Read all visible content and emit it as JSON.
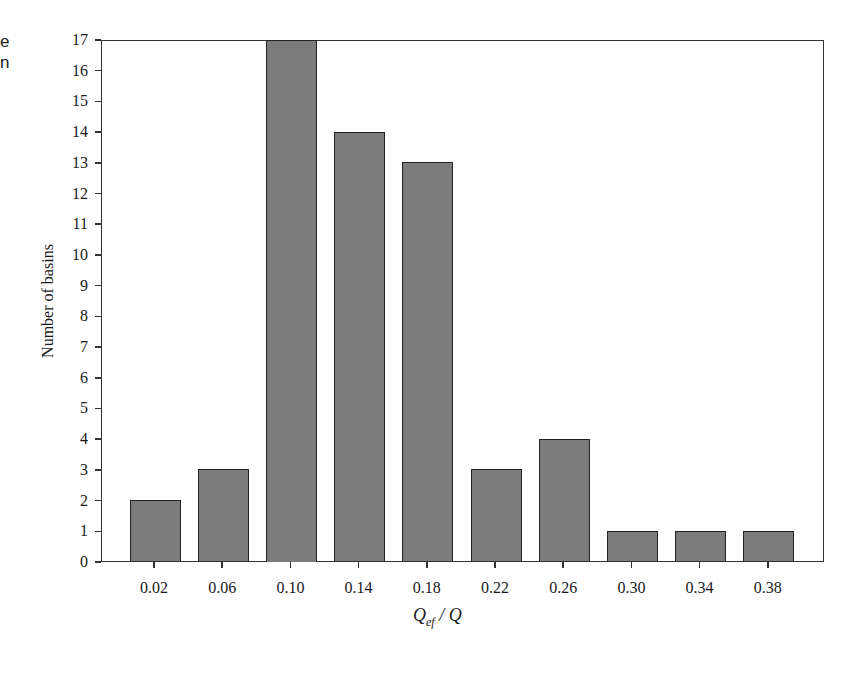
{
  "page_fragment": {
    "line1": "e",
    "line2": "n"
  },
  "chart_data": {
    "type": "bar",
    "title": "",
    "categories": [
      "0.02",
      "0.06",
      "0.10",
      "0.14",
      "0.18",
      "0.22",
      "0.26",
      "0.30",
      "0.34",
      "0.38"
    ],
    "values": [
      2,
      3,
      17,
      14,
      13,
      3,
      4,
      1,
      1,
      1
    ],
    "xlabel": "Q_ef / Q",
    "xlabel_parts": {
      "q1": "Q",
      "sub": "ef",
      "sep": " / ",
      "q2": "Q"
    },
    "ylabel": "Number of basins",
    "ylim": [
      0,
      17
    ],
    "yticks": [
      0,
      1,
      2,
      3,
      4,
      5,
      6,
      7,
      8,
      9,
      10,
      11,
      12,
      13,
      14,
      15,
      16,
      17
    ],
    "grid": false,
    "legend": null,
    "bar_color": "#7b7b7b",
    "edge_color": "#222222"
  }
}
